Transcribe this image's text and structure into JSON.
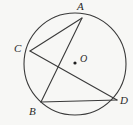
{
  "figure": {
    "kind": "circle-geometry-diagram",
    "width": 133,
    "height": 125,
    "background_color": "#f7f7f5",
    "stroke_color": "#3a3a3a",
    "label_color": "#2a2a2a"
  },
  "circle": {
    "name": "circle-O",
    "center_x": 75,
    "center_y": 64,
    "radius": 51,
    "stroke_width": 1.1
  },
  "center_point": {
    "label": "O",
    "dot_x": 75,
    "dot_y": 63,
    "dot_radius": 1.6,
    "label_x": 80,
    "label_y": 54
  },
  "points": [
    {
      "id": "A",
      "label": "A",
      "x": 82,
      "y": 18,
      "label_x": 77,
      "label_y": 1
    },
    {
      "id": "C",
      "label": "C",
      "x": 30,
      "y": 51,
      "label_x": 14,
      "label_y": 43
    },
    {
      "id": "B",
      "label": "B",
      "x": 41,
      "y": 102,
      "label_x": 29,
      "label_y": 106
    },
    {
      "id": "D",
      "label": "D",
      "x": 117,
      "y": 100,
      "label_x": 120,
      "label_y": 95
    }
  ],
  "chords": [
    {
      "id": "AC",
      "from": "A",
      "to": "C",
      "x1": 82,
      "y1": 18,
      "x2": 30,
      "y2": 51
    },
    {
      "id": "AB",
      "from": "A",
      "to": "B",
      "x1": 82,
      "y1": 18,
      "x2": 41,
      "y2": 102
    },
    {
      "id": "CD",
      "from": "C",
      "to": "D",
      "x1": 30,
      "y1": 51,
      "x2": 117,
      "y2": 100
    },
    {
      "id": "BD",
      "from": "B",
      "to": "D",
      "x1": 41,
      "y1": 102,
      "x2": 117,
      "y2": 100
    }
  ]
}
